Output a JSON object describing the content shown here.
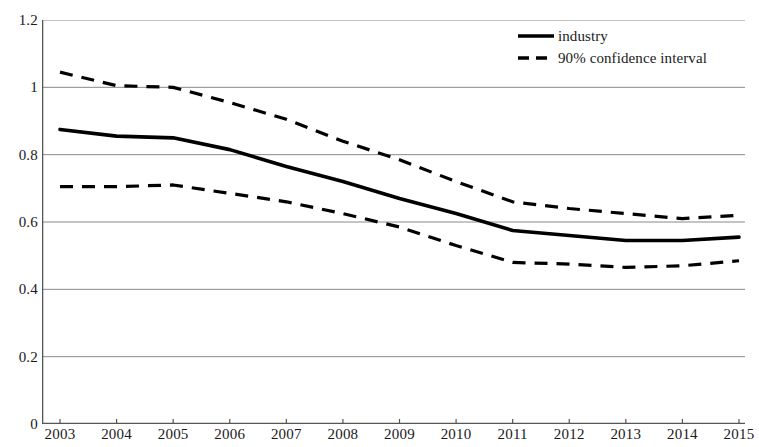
{
  "chart_data": {
    "type": "line",
    "title": "",
    "subtitle": "",
    "xlabel": "",
    "ylabel": "",
    "categories": [
      "2003",
      "2004",
      "2005",
      "2006",
      "2007",
      "2008",
      "2009",
      "2010",
      "2011",
      "2012",
      "2013",
      "2014",
      "2015"
    ],
    "x": [
      2003,
      2004,
      2005,
      2006,
      2007,
      2008,
      2009,
      2010,
      2011,
      2012,
      2013,
      2014,
      2015
    ],
    "ylim": [
      0,
      1.2
    ],
    "xlim": [
      2003,
      2015
    ],
    "y_ticks": [
      0,
      0.2,
      0.4,
      0.6,
      0.8,
      1,
      1.2
    ],
    "y_tick_labels": [
      "0",
      "0.2",
      "0.4",
      "0.6",
      "0.8",
      "1",
      "1.2"
    ],
    "grid": "horizontal",
    "legend_position": "top-right",
    "series": [
      {
        "name": "industry",
        "style": "solid",
        "color": "#000000",
        "values": [
          0.875,
          0.855,
          0.85,
          0.815,
          0.765,
          0.72,
          0.67,
          0.625,
          0.575,
          0.56,
          0.545,
          0.545,
          0.555
        ]
      },
      {
        "name": "90% confidence interval",
        "style": "dashed",
        "color": "#000000",
        "bound": "upper",
        "values": [
          1.045,
          1.005,
          1.0,
          0.955,
          0.905,
          0.84,
          0.785,
          0.72,
          0.66,
          0.64,
          0.625,
          0.61,
          0.62
        ]
      },
      {
        "name": "90% confidence interval",
        "style": "dashed",
        "color": "#000000",
        "bound": "lower",
        "values": [
          0.705,
          0.705,
          0.71,
          0.685,
          0.66,
          0.625,
          0.585,
          0.53,
          0.48,
          0.475,
          0.465,
          0.47,
          0.485
        ]
      }
    ]
  },
  "legend": {
    "items": [
      {
        "label": "industry",
        "style": "solid"
      },
      {
        "label": "90% confidence interval",
        "style": "dashed"
      }
    ]
  },
  "axes": {
    "y_labels": [
      "1.2",
      "1",
      "0.8",
      "0.6",
      "0.4",
      "0.2",
      "0"
    ],
    "x_labels": [
      "2003",
      "2004",
      "2005",
      "2006",
      "2007",
      "2008",
      "2009",
      "2010",
      "2011",
      "2012",
      "2013",
      "2014",
      "2015"
    ]
  },
  "colors": {
    "line": "#000000",
    "grid": "#8a8a8a",
    "axis": "#555555",
    "text": "#1a1a1a",
    "background": "#ffffff"
  }
}
